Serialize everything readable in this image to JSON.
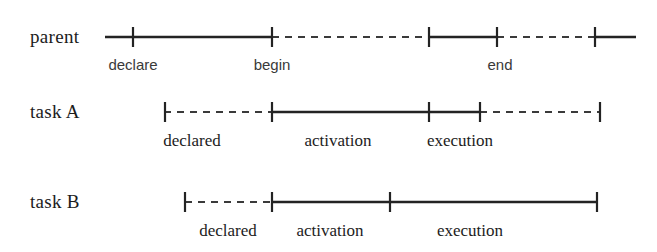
{
  "figure": {
    "kind": "timeline-diagram",
    "background_color": "#ffffff",
    "line_color": "#232323",
    "dashed_color": "#3a3a3a",
    "text_color": "#1c1c1c"
  },
  "rows": [
    {
      "id": "parent",
      "label": "parent",
      "label_x": 30,
      "label_y": 43,
      "axis_y": 37,
      "tick_half_height": 10,
      "segments": [
        {
          "name": "parent-seg-1-solid",
          "style": "solid",
          "x1": 105,
          "x2": 272
        },
        {
          "name": "parent-seg-2-dashed",
          "style": "dashed",
          "x1": 272,
          "x2": 429
        },
        {
          "name": "parent-seg-3-solid",
          "style": "solid",
          "x1": 429,
          "x2": 497
        },
        {
          "name": "parent-seg-4-dashed",
          "style": "dashed",
          "x1": 497,
          "x2": 595
        },
        {
          "name": "parent-seg-5-solid",
          "style": "solid",
          "x1": 595,
          "x2": 636
        }
      ],
      "ticks": [
        {
          "name": "tick-declare",
          "x": 133
        },
        {
          "name": "tick-begin",
          "x": 272
        },
        {
          "name": "tick-resume",
          "x": 429
        },
        {
          "name": "tick-end",
          "x": 497
        },
        {
          "name": "tick-final",
          "x": 595
        }
      ],
      "captions": [
        {
          "name": "caption-declare",
          "text": "declare",
          "x": 133,
          "y": 70,
          "font": "sans"
        },
        {
          "name": "caption-begin",
          "text": "begin",
          "x": 272,
          "y": 70,
          "font": "sans"
        },
        {
          "name": "caption-end",
          "text": "end",
          "x": 500,
          "y": 70,
          "font": "sans"
        }
      ]
    },
    {
      "id": "task-a",
      "label": "task A",
      "label_x": 30,
      "label_y": 118,
      "axis_y": 112,
      "tick_half_height": 10,
      "segments": [
        {
          "name": "taska-seg-1-dashed",
          "style": "dashed",
          "x1": 164,
          "x2": 272
        },
        {
          "name": "taska-seg-2-solid",
          "style": "solid",
          "x1": 272,
          "x2": 480
        },
        {
          "name": "taska-seg-3-dashed",
          "style": "dashed",
          "x1": 480,
          "x2": 600
        }
      ],
      "ticks": [
        {
          "name": "tick-taska-declared",
          "x": 165
        },
        {
          "name": "tick-taska-activation",
          "x": 272
        },
        {
          "name": "tick-taska-execution",
          "x": 429
        },
        {
          "name": "tick-taska-complete",
          "x": 480
        },
        {
          "name": "tick-taska-terminated",
          "x": 600
        }
      ],
      "captions": [
        {
          "name": "caption-taska-declared",
          "text": "declared",
          "x": 192,
          "y": 146,
          "font": "serif"
        },
        {
          "name": "caption-taska-activation",
          "text": "activation",
          "x": 338,
          "y": 146,
          "font": "serif"
        },
        {
          "name": "caption-taska-execution",
          "text": "execution",
          "x": 460,
          "y": 146,
          "font": "serif"
        }
      ]
    },
    {
      "id": "task-b",
      "label": "task B",
      "label_x": 30,
      "label_y": 208,
      "axis_y": 202,
      "tick_half_height": 10,
      "segments": [
        {
          "name": "taskb-seg-1-dashed",
          "style": "dashed",
          "x1": 185,
          "x2": 272
        },
        {
          "name": "taskb-seg-2-solid",
          "style": "solid",
          "x1": 272,
          "x2": 597
        }
      ],
      "ticks": [
        {
          "name": "tick-taskb-declared",
          "x": 185
        },
        {
          "name": "tick-taskb-activation",
          "x": 272
        },
        {
          "name": "tick-taskb-execution",
          "x": 390
        },
        {
          "name": "tick-taskb-terminated",
          "x": 597
        }
      ],
      "captions": [
        {
          "name": "caption-taskb-declared",
          "text": "declared",
          "x": 228,
          "y": 236,
          "font": "serif"
        },
        {
          "name": "caption-taskb-activation",
          "text": "activation",
          "x": 330,
          "y": 236,
          "font": "serif"
        },
        {
          "name": "caption-taskb-execution",
          "text": "execution",
          "x": 470,
          "y": 236,
          "font": "serif"
        }
      ]
    }
  ]
}
